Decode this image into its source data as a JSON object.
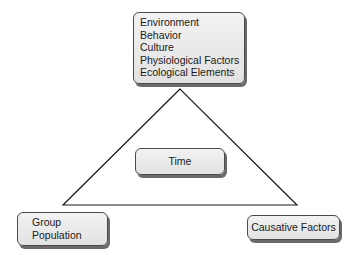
{
  "diagram": {
    "type": "epidemiologic-triangle",
    "top_box": {
      "lines": [
        "Environment",
        "Behavior",
        "Culture",
        "Physiological Factors",
        "Ecological Elements"
      ]
    },
    "center_box": {
      "label": "Time"
    },
    "bottom_left_box": {
      "lines": [
        "Group",
        "Population"
      ]
    },
    "bottom_right_box": {
      "label": "Causative Factors"
    },
    "triangle": {
      "apex": [
        180,
        89
      ],
      "bottom_left": [
        63,
        205
      ],
      "bottom_right": [
        297,
        205
      ],
      "stroke": "#1a1a1a"
    },
    "colors": {
      "box_fill": "#e8e8e8",
      "box_border": "#4a4a4a",
      "box_shadow": "#6a6a6a",
      "text": "#1a1a1a"
    }
  }
}
